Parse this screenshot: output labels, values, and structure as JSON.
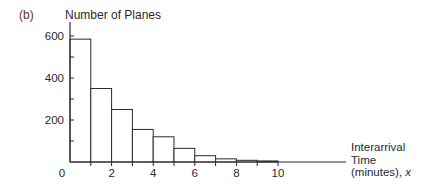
{
  "panel_label": "(b)",
  "chart_data": {
    "type": "bar",
    "title": "",
    "ylabel": "Number of Planes",
    "xlabel": "Interarrival Time (minutes), x",
    "xlabel_lines": [
      "Interarrival",
      "Time",
      "(minutes), "
    ],
    "xlabel_var": "x",
    "bin_edges": [
      0,
      1,
      2,
      3,
      4,
      5,
      6,
      7,
      8,
      9,
      10
    ],
    "categories": [
      "0-1",
      "1-2",
      "2-3",
      "3-4",
      "4-5",
      "5-6",
      "6-7",
      "7-8",
      "8-9",
      "9-10"
    ],
    "values": [
      585,
      350,
      250,
      155,
      120,
      65,
      30,
      15,
      8,
      5
    ],
    "xticks": [
      0,
      2,
      4,
      6,
      8,
      10
    ],
    "yticks": [
      200,
      400,
      600
    ],
    "ylim": [
      0,
      660
    ],
    "xlim": [
      0,
      13.3
    ],
    "grid": false,
    "legend": null,
    "style": {
      "bar_fill": "#ffffff",
      "bar_stroke": "#2a2a2a",
      "axis_color": "#2a2a2a",
      "panel_label_color": "#6b2f2a"
    }
  }
}
